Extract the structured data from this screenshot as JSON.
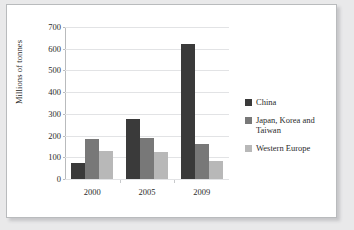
{
  "chart_data": {
    "type": "bar",
    "title": "",
    "xlabel": "",
    "ylabel": "Millions of tonnes",
    "categories": [
      "2000",
      "2005",
      "2009"
    ],
    "series": [
      {
        "name": "China",
        "values": [
          75,
          275,
          620
        ],
        "color": "#3a3a3a"
      },
      {
        "name": "Japan, Korea and Taiwan",
        "values": [
          183,
          190,
          162
        ],
        "color": "#787878"
      },
      {
        "name": "Western Europe",
        "values": [
          130,
          125,
          82
        ],
        "color": "#b8b8b8"
      }
    ],
    "ylim": [
      0,
      700
    ],
    "ytick_labels": [
      "0",
      "100",
      "200",
      "300",
      "400",
      "500",
      "600",
      "700"
    ],
    "ytick_values": [
      0,
      100,
      200,
      300,
      400,
      500,
      600,
      700
    ],
    "grid": true,
    "legend_position": "right"
  },
  "legend": {
    "entries": [
      {
        "label": "China"
      },
      {
        "label": "Japan, Korea and Taiwan"
      },
      {
        "label": "Western Europe"
      }
    ]
  }
}
